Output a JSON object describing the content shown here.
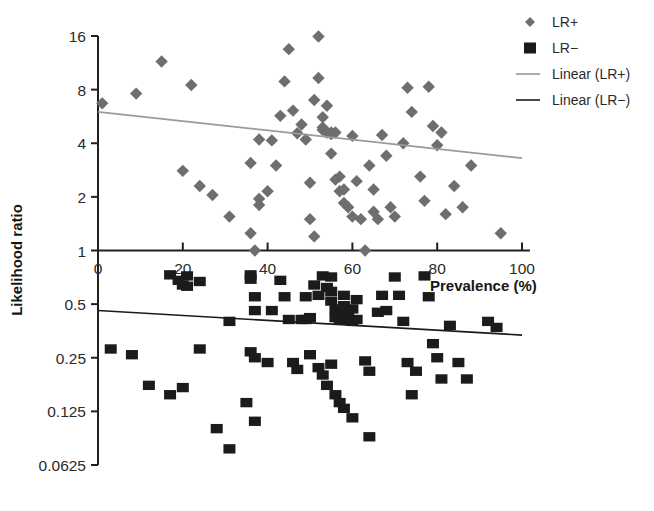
{
  "chart_data": {
    "type": "scatter",
    "title": "",
    "xlabel": "Prevalence (%)",
    "ylabel": "Likelihood ratio",
    "xlim": [
      0,
      100
    ],
    "ylim": [
      0.0625,
      16
    ],
    "yscale": "log2",
    "xticks": [
      0,
      20,
      40,
      60,
      80,
      100
    ],
    "xtick_labels": [
      "0",
      "20",
      "40",
      "60",
      "80",
      "100"
    ],
    "yticks": [
      16,
      8,
      4,
      2,
      1,
      0.5,
      0.25,
      0.125,
      0.0625
    ],
    "ytick_labels": [
      "16",
      "8",
      "4",
      "2",
      "1",
      "0.5",
      "0.25",
      "0.125",
      "0.0625"
    ],
    "grid": false,
    "legend_position": "top-right",
    "colors": {
      "lr_plus_marker": "#6e6e6e",
      "lr_minus_marker": "#1b1b1b",
      "lr_plus_line": "#9a9a9a",
      "lr_minus_line": "#1b1b1b",
      "axis": "#231f20",
      "background": "#ffffff"
    },
    "legend": [
      {
        "label": "LR+",
        "marker": "diamond",
        "color": "#6e6e6e",
        "kind": "marker"
      },
      {
        "label": "LR−",
        "marker": "square",
        "color": "#1b1b1b",
        "kind": "marker"
      },
      {
        "label": "Linear (LR+)",
        "marker": "line",
        "color": "#9a9a9a",
        "kind": "line"
      },
      {
        "label": "Linear (LR−)",
        "marker": "line",
        "color": "#1b1b1b",
        "kind": "line"
      }
    ],
    "series": [
      {
        "name": "LR+",
        "marker": "diamond",
        "color": "#6e6e6e",
        "points": [
          [
            1,
            6.7
          ],
          [
            9,
            7.6
          ],
          [
            15,
            11.5
          ],
          [
            22,
            8.5
          ],
          [
            20,
            2.8
          ],
          [
            24,
            2.3
          ],
          [
            27,
            2.05
          ],
          [
            31,
            1.55
          ],
          [
            36,
            3.1
          ],
          [
            38,
            4.2
          ],
          [
            38,
            1.95
          ],
          [
            38,
            1.8
          ],
          [
            36,
            1.25
          ],
          [
            37,
            1.0
          ],
          [
            40,
            2.15
          ],
          [
            41,
            4.15
          ],
          [
            42,
            3.0
          ],
          [
            43,
            5.7
          ],
          [
            44,
            8.9
          ],
          [
            45,
            13.5
          ],
          [
            46,
            6.1
          ],
          [
            47,
            4.55
          ],
          [
            48,
            5.1
          ],
          [
            49,
            4.2
          ],
          [
            50,
            2.4
          ],
          [
            50,
            1.5
          ],
          [
            51,
            1.2
          ],
          [
            51,
            7.0
          ],
          [
            52,
            9.3
          ],
          [
            52,
            15.9
          ],
          [
            53,
            5.6
          ],
          [
            53,
            4.9
          ],
          [
            53,
            4.75
          ],
          [
            54,
            6.5
          ],
          [
            54,
            4.6
          ],
          [
            55,
            4.6
          ],
          [
            55,
            4.5
          ],
          [
            56,
            4.6
          ],
          [
            55,
            3.5
          ],
          [
            56,
            2.5
          ],
          [
            57,
            2.6
          ],
          [
            57,
            2.15
          ],
          [
            58,
            1.85
          ],
          [
            58,
            2.2
          ],
          [
            59,
            1.75
          ],
          [
            60,
            1.55
          ],
          [
            60,
            4.4
          ],
          [
            61,
            2.45
          ],
          [
            62,
            1.5
          ],
          [
            63,
            1.0
          ],
          [
            64,
            3.0
          ],
          [
            65,
            2.2
          ],
          [
            65,
            1.65
          ],
          [
            66,
            1.5
          ],
          [
            67,
            4.45
          ],
          [
            68,
            3.4
          ],
          [
            69,
            1.75
          ],
          [
            70,
            1.55
          ],
          [
            72,
            4.0
          ],
          [
            73,
            8.2
          ],
          [
            74,
            6.0
          ],
          [
            76,
            2.6
          ],
          [
            77,
            1.9
          ],
          [
            78,
            8.3
          ],
          [
            79,
            5.0
          ],
          [
            80,
            3.9
          ],
          [
            81,
            4.6
          ],
          [
            82,
            1.6
          ],
          [
            84,
            2.3
          ],
          [
            86,
            1.75
          ],
          [
            88,
            3.0
          ],
          [
            95,
            1.25
          ]
        ]
      },
      {
        "name": "LR−",
        "marker": "square",
        "color": "#1b1b1b",
        "points": [
          [
            17,
            0.73
          ],
          [
            19,
            0.68
          ],
          [
            20,
            0.64
          ],
          [
            21,
            0.63
          ],
          [
            21,
            0.72
          ],
          [
            24,
            0.67
          ],
          [
            3,
            0.28
          ],
          [
            8,
            0.26
          ],
          [
            12,
            0.175
          ],
          [
            17,
            0.155
          ],
          [
            24,
            0.28
          ],
          [
            20,
            0.17
          ],
          [
            28,
            0.1
          ],
          [
            31,
            0.077
          ],
          [
            36,
            0.73
          ],
          [
            36,
            0.69
          ],
          [
            37,
            0.55
          ],
          [
            37,
            0.46
          ],
          [
            41,
            0.46
          ],
          [
            43,
            0.68
          ],
          [
            44,
            0.55
          ],
          [
            31,
            0.4
          ],
          [
            45,
            0.41
          ],
          [
            36,
            0.27
          ],
          [
            37,
            0.25
          ],
          [
            40,
            0.235
          ],
          [
            46,
            0.235
          ],
          [
            35,
            0.14
          ],
          [
            37,
            0.11
          ],
          [
            47,
            0.215
          ],
          [
            49,
            0.55
          ],
          [
            48,
            0.41
          ],
          [
            50,
            0.42
          ],
          [
            51,
            0.64
          ],
          [
            52,
            0.56
          ],
          [
            53,
            0.72
          ],
          [
            54,
            0.62
          ],
          [
            55,
            0.71
          ],
          [
            55,
            0.59
          ],
          [
            55,
            0.52
          ],
          [
            56,
            0.47
          ],
          [
            56,
            0.42
          ],
          [
            57,
            0.41
          ],
          [
            57,
            0.45
          ],
          [
            58,
            0.56
          ],
          [
            58,
            0.49
          ],
          [
            59,
            0.44
          ],
          [
            59,
            0.41
          ],
          [
            60,
            0.4
          ],
          [
            60,
            0.47
          ],
          [
            61,
            0.41
          ],
          [
            61,
            0.53
          ],
          [
            49,
            0.41
          ],
          [
            50,
            0.26
          ],
          [
            52,
            0.22
          ],
          [
            53,
            0.2
          ],
          [
            54,
            0.175
          ],
          [
            55,
            0.23
          ],
          [
            56,
            0.155
          ],
          [
            57,
            0.14
          ],
          [
            58,
            0.13
          ],
          [
            60,
            0.115
          ],
          [
            64,
            0.09
          ],
          [
            63,
            0.24
          ],
          [
            64,
            0.21
          ],
          [
            66,
            0.45
          ],
          [
            67,
            0.56
          ],
          [
            68,
            0.46
          ],
          [
            70,
            0.71
          ],
          [
            71,
            0.56
          ],
          [
            72,
            0.4
          ],
          [
            73,
            0.235
          ],
          [
            74,
            0.155
          ],
          [
            75,
            0.21
          ],
          [
            77,
            0.72
          ],
          [
            78,
            0.55
          ],
          [
            79,
            0.3
          ],
          [
            80,
            0.25
          ],
          [
            81,
            0.19
          ],
          [
            83,
            0.38
          ],
          [
            85,
            0.235
          ],
          [
            87,
            0.19
          ],
          [
            94,
            0.37
          ],
          [
            92,
            0.4
          ]
        ]
      }
    ],
    "trendlines": [
      {
        "name": "Linear (LR+)",
        "color": "#9a9a9a",
        "x0": 0,
        "y0": 6.0,
        "x1": 100,
        "y1": 3.3
      },
      {
        "name": "Linear (LR−)",
        "color": "#1b1b1b",
        "x0": 0,
        "y0": 0.46,
        "x1": 100,
        "y1": 0.335
      }
    ]
  }
}
